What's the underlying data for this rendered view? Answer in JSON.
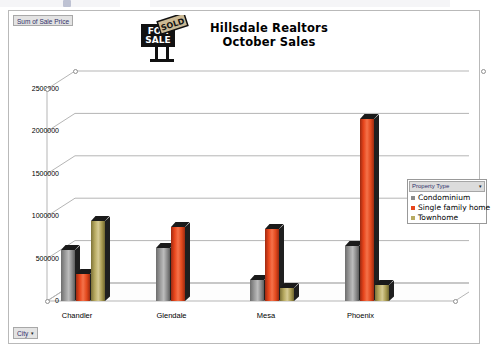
{
  "window": {
    "toolbar_visible_fragment": true
  },
  "chart_object": {
    "value_field_label": "Sum of Sale Price",
    "category_field_label": "City",
    "category_field_arrow": "▾",
    "title_line1": "Hillsdale Realtors",
    "title_line2": "October Sales",
    "sign_text_for": "FOR",
    "sign_text_sale": "SALE",
    "sign_text_sold": "SOLD",
    "selected": true
  },
  "legend": {
    "header_label": "Property Type",
    "header_arrow": "▾",
    "items": [
      {
        "label": "Condominium",
        "color": "#8a8a8a"
      },
      {
        "label": "Single family home",
        "color": "#e8461c"
      },
      {
        "label": "Townhome",
        "color": "#b8ab62"
      }
    ]
  },
  "chart_data": {
    "type": "bar",
    "title": "Hillsdale Realtors October Sales",
    "xlabel": "City",
    "ylabel": "Sum of Sale Price",
    "ylim": [
      0,
      2500000
    ],
    "yticks": [
      0,
      500000,
      1000000,
      1500000,
      2000000,
      2500000
    ],
    "ytick_labels": [
      "0",
      "500000",
      "1000000",
      "1500000",
      "2000000",
      "2500000"
    ],
    "grid": true,
    "legend_position": "right",
    "three_d": true,
    "categories": [
      "Chandler",
      "Glendale",
      "Mesa",
      "Phoenix"
    ],
    "series": [
      {
        "name": "Condominium",
        "color": "#8a8a8a",
        "values": [
          600000,
          620000,
          250000,
          650000
        ]
      },
      {
        "name": "Single family home",
        "color": "#e8461c",
        "values": [
          320000,
          870000,
          850000,
          2150000
        ]
      },
      {
        "name": "Townhome",
        "color": "#b8ab62",
        "values": [
          940000,
          0,
          150000,
          190000
        ]
      }
    ]
  }
}
